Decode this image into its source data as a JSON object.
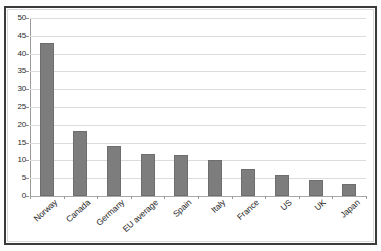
{
  "figure": {
    "title_remnant": "",
    "background_color": "#ffffff",
    "frame_color": "#3a3a3a",
    "bar_color": "#7d7d7d",
    "gridline_color": "#dcdcdc",
    "axis_color": "#9a9a9a"
  },
  "chart_data": {
    "type": "bar",
    "title": "",
    "xlabel": "",
    "ylabel": "",
    "categories": [
      "Norway",
      "Canada",
      "Germany",
      "EU average",
      "Spain",
      "Italy",
      "France",
      "US",
      "UK",
      "Japan"
    ],
    "values": [
      43.0,
      18.3,
      14.0,
      11.8,
      11.4,
      10.1,
      7.7,
      6.0,
      4.4,
      3.4
    ],
    "ylim": [
      0,
      50
    ],
    "ytick_labels": [
      "50",
      "45",
      "40",
      "35",
      "30",
      "25",
      "20",
      "15",
      "10",
      "5",
      "0"
    ],
    "ytick_values": [
      50,
      45,
      40,
      35,
      30,
      25,
      20,
      15,
      10,
      5,
      0
    ],
    "ytick_step": 5,
    "grid": true,
    "legend": false,
    "series": [
      {
        "name": "",
        "values": [
          43.0,
          18.3,
          14.0,
          11.8,
          11.4,
          10.1,
          7.7,
          6.0,
          4.4,
          3.4
        ]
      }
    ]
  }
}
